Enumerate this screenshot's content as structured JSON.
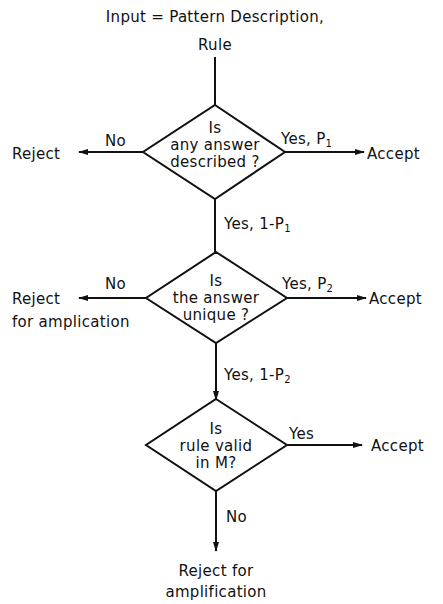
{
  "input": {
    "line1": "Input = Pattern Description,",
    "line2": "Rule"
  },
  "decisions": [
    {
      "question_lines": [
        "Is",
        "any answer",
        "described ?"
      ],
      "left": {
        "label": "No",
        "outcome": [
          "Reject"
        ]
      },
      "right": {
        "label": "Yes, P",
        "sub": "1",
        "outcome": "Accept"
      },
      "down": {
        "label": "Yes, 1-P",
        "sub": "1"
      }
    },
    {
      "question_lines": [
        "Is",
        "the answer",
        "unique ?"
      ],
      "left": {
        "label": "No",
        "outcome": [
          "Reject",
          "for amplication"
        ]
      },
      "right": {
        "label": "Yes, P",
        "sub": "2",
        "outcome": "Accept"
      },
      "down": {
        "label": "Yes, 1-P",
        "sub": "2"
      }
    },
    {
      "question_lines": [
        "Is",
        "rule valid",
        "in M?"
      ],
      "right": {
        "label": "Yes",
        "outcome": "Accept"
      },
      "down": {
        "label": "No",
        "outcome": [
          "Reject for",
          "amplification"
        ]
      }
    }
  ],
  "colors": {
    "ink": "#111111",
    "background": "#ffffff"
  }
}
